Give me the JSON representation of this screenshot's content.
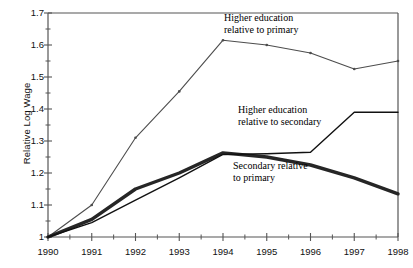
{
  "chart_data": {
    "type": "line",
    "title": "",
    "xlabel": "",
    "ylabel": "Relative Log Wage",
    "x": [
      1990,
      1991,
      1992,
      1993,
      1994,
      1995,
      1996,
      1997,
      1998
    ],
    "xtick_labels": [
      "1990",
      "1991",
      "1992",
      "1993",
      "1994",
      "1995",
      "1996",
      "1997",
      "1998"
    ],
    "ytick_labels": [
      "1",
      "1.1",
      "1.2",
      "1.3",
      "1.4",
      "1.5",
      "1.6",
      "1.7"
    ],
    "ytick_values": [
      1,
      1.1,
      1.2,
      1.3,
      1.4,
      1.5,
      1.6,
      1.7
    ],
    "ylim": [
      1,
      1.7
    ],
    "xlim": [
      1990,
      1998
    ],
    "minor_ticks": true,
    "minor_tick_step": 0.05,
    "grid": false,
    "legend": "inline-annotations",
    "series": [
      {
        "name": "Higher education relative to primary",
        "key": "higher_vs_primary",
        "values": [
          1.0,
          1.1,
          1.31,
          1.455,
          1.615,
          1.6,
          1.575,
          1.525,
          1.55
        ],
        "color": "#4d4d4d",
        "width": 1.1,
        "markers": true
      },
      {
        "name": "Secondary relative to primary",
        "key": "secondary_vs_primary",
        "values": [
          1.0,
          1.055,
          1.15,
          1.2,
          1.263,
          1.25,
          1.225,
          1.185,
          1.135
        ],
        "color": "#262626",
        "width": 3.4,
        "markers": false
      },
      {
        "name": "Higher education relative to secondary",
        "key": "higher_vs_secondary",
        "values": [
          1.0,
          1.045,
          1.115,
          1.185,
          1.258,
          1.26,
          1.265,
          1.39,
          1.39
        ],
        "color": "#111111",
        "width": 1.4,
        "markers": false
      }
    ],
    "annotations": [
      {
        "key": "hp",
        "line1": "Higher education",
        "line2": "relative to primary"
      },
      {
        "key": "hs",
        "line1": "Higher education",
        "line2": "relative to secondary"
      },
      {
        "key": "sp",
        "line1": "Secondary relative",
        "line2": "to primary"
      }
    ],
    "axis_color": "#555555",
    "background": "#ffffff"
  }
}
